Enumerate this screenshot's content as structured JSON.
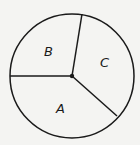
{
  "diagram": {
    "type": "circle-partitioned",
    "center": [
      72,
      76
    ],
    "radius": 62,
    "stroke_color": "#1a1a1a",
    "background": "#f4f4f2",
    "radii_endpoints": [
      {
        "name": "top",
        "point": [
          82,
          13
        ]
      },
      {
        "name": "left",
        "point": [
          10,
          76
        ]
      },
      {
        "name": "lower-right",
        "point": [
          117,
          117
        ]
      }
    ],
    "regions": [
      {
        "label": "B",
        "position": [
          49,
          55
        ]
      },
      {
        "label": "C",
        "position": [
          105,
          67
        ]
      },
      {
        "label": "A",
        "position": [
          60,
          112
        ]
      }
    ]
  }
}
